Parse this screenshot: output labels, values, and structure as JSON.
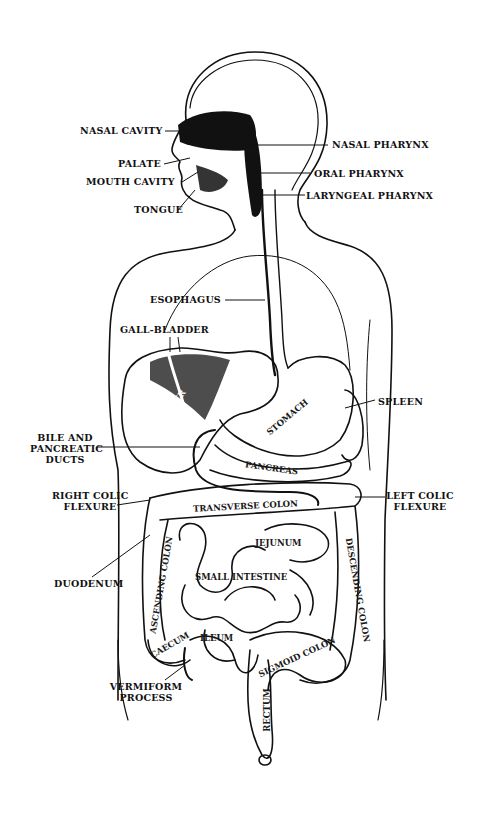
{
  "figure": {
    "ink_color": "#111111",
    "paper_color": "#ffffff"
  },
  "labels": {
    "nasal_cavity": "NASAL CAVITY",
    "palate": "PALATE",
    "mouth_cavity": "MOUTH CAVITY",
    "tongue": "TONGUE",
    "nasal_pharynx": "NASAL PHARYNX",
    "oral_pharynx": "ORAL PHARYNX",
    "laryngeal_pharynx": "LARYNGEAL PHARYNX",
    "esophagus": "ESOPHAGUS",
    "gall_bladder": "GALL-BLADDER",
    "spleen": "SPLEEN",
    "bile_ducts_line1": "BILE AND",
    "bile_ducts_line2": "PANCREATIC",
    "bile_ducts_line3": "DUCTS",
    "right_colic_line1": "RIGHT COLIC",
    "right_colic_line2": "FLEXURE",
    "left_colic_line1": "LEFT COLIC",
    "left_colic_line2": "FLEXURE",
    "duodenum": "DUODENUM",
    "vermiform_line1": "VERMIFORM",
    "vermiform_line2": "PROCESS"
  },
  "organ_labels": {
    "liver": "LIVER",
    "stomach": "STOMACH",
    "pancreas": "PANCREAS",
    "transverse_colon": "TRANSVERSE COLON",
    "jejunum": "JEJUNUM",
    "small_intestine": "SMALL INTESTINE",
    "ascending_colon": "ASCENDING COLON",
    "descending_colon": "DESCENDING COLON",
    "caecum": "CAECUM",
    "ileum": "ILEUM",
    "sigmoid_colon": "SIGMOID COLON",
    "rectum": "RECTUM"
  }
}
